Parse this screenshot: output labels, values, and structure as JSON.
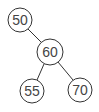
{
  "diagram": {
    "type": "binary-tree",
    "colors": {
      "stroke": "#333333",
      "text": "#444444",
      "fill": "#ffffff"
    },
    "nodes": [
      {
        "id": "n50",
        "label": "50",
        "cx": 20,
        "cy": 20,
        "r": 12
      },
      {
        "id": "n60",
        "label": "60",
        "cx": 50,
        "cy": 52,
        "r": 13
      },
      {
        "id": "n55",
        "label": "55",
        "cx": 32,
        "cy": 91,
        "r": 12
      },
      {
        "id": "n70",
        "label": "70",
        "cx": 80,
        "cy": 90,
        "r": 12
      }
    ],
    "edges": [
      {
        "from": "50",
        "to": "60"
      },
      {
        "from": "60",
        "to": "55"
      },
      {
        "from": "60",
        "to": "70"
      }
    ]
  }
}
